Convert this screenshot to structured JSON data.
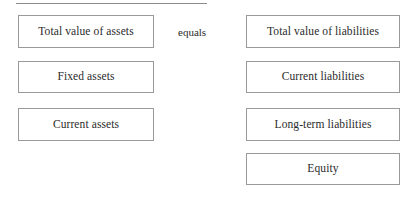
{
  "diagram": {
    "title_rule": "",
    "connector": {
      "label": "equals"
    },
    "left_column": {
      "name": "assets",
      "boxes": [
        {
          "label": "Total value of assets"
        },
        {
          "label": "Fixed assets"
        },
        {
          "label": "Current assets"
        }
      ]
    },
    "right_column": {
      "name": "liabilities-and-equity",
      "boxes": [
        {
          "label": "Total value of liabilities"
        },
        {
          "label": "Current liabilities"
        },
        {
          "label": "Long-term liabilities"
        },
        {
          "label": "Equity"
        }
      ]
    },
    "colors": {
      "box_border": "#9a9a9a",
      "text": "#2b2b2b",
      "rule": "#8d8d8d",
      "background": "#ffffff"
    }
  }
}
